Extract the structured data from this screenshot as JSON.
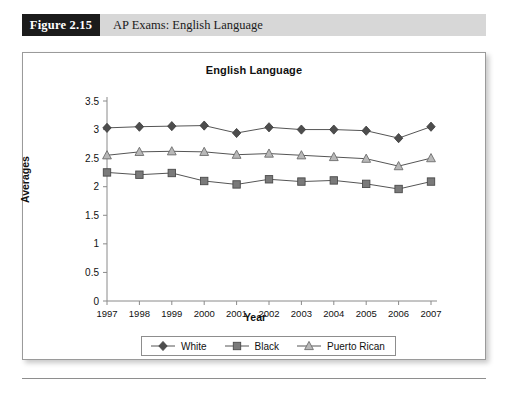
{
  "caption": {
    "figure_label": "Figure 2.15",
    "title": "AP Exams: English Language"
  },
  "chart_data": {
    "type": "line",
    "title": "English Language",
    "xlabel": "Year",
    "ylabel": "Averages",
    "categories": [
      "1997",
      "1998",
      "1999",
      "2000",
      "2001",
      "2002",
      "2003",
      "2004",
      "2005",
      "2006",
      "2007"
    ],
    "ylim": [
      0,
      3.5
    ],
    "ytick_step": 0.5,
    "yticks": [
      "0",
      "0.5",
      "1",
      "1.5",
      "2",
      "2.5",
      "3",
      "3.5"
    ],
    "grid": false,
    "legend_position": "bottom",
    "series": [
      {
        "name": "White",
        "marker": "diamond",
        "color": "#4d4d4d",
        "values": [
          3.03,
          3.05,
          3.06,
          3.07,
          2.94,
          3.04,
          3.0,
          3.0,
          2.98,
          2.85,
          3.05
        ]
      },
      {
        "name": "Black",
        "marker": "square",
        "color": "#7a7a7a",
        "values": [
          2.25,
          2.21,
          2.24,
          2.1,
          2.04,
          2.13,
          2.09,
          2.11,
          2.05,
          1.96,
          2.09
        ]
      },
      {
        "name": "Puerto Rican",
        "marker": "triangle",
        "color": "#b8b8b8",
        "values": [
          2.55,
          2.61,
          2.62,
          2.61,
          2.56,
          2.58,
          2.55,
          2.52,
          2.49,
          2.36,
          2.5
        ]
      }
    ]
  }
}
